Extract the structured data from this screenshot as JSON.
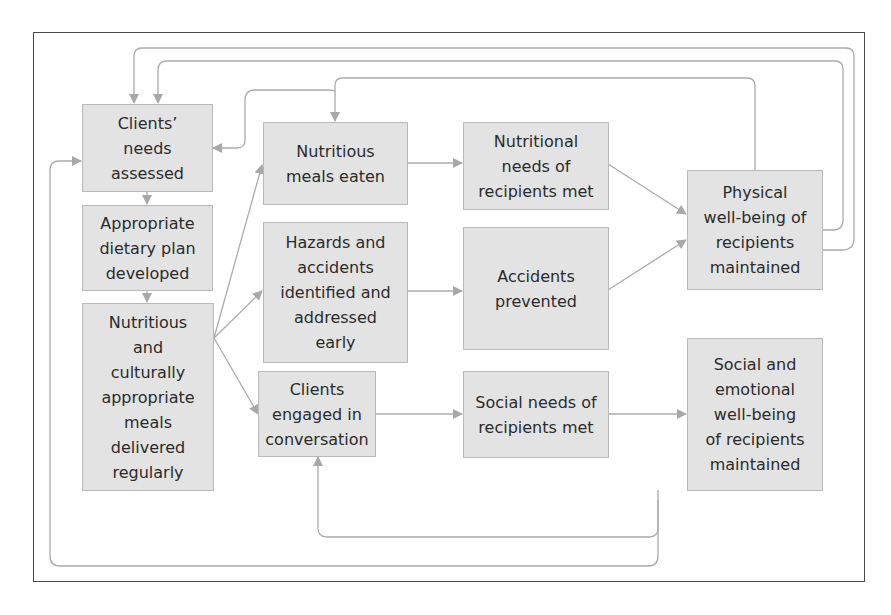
{
  "diagram": {
    "type": "logic-model-flowchart",
    "colors": {
      "box_fill": "#e3e3e3",
      "box_border": "#b9b9b9",
      "arrow": "#a8a8a8",
      "frame": "#4a4a4a",
      "text": "#2b2b2b"
    },
    "nodes": [
      {
        "id": "needs",
        "label": "Clients' needs assessed"
      },
      {
        "id": "plan",
        "label": "Appropriate dietary plan developed"
      },
      {
        "id": "meals",
        "label": "Nutritious and culturally appropriate meals delivered regularly"
      },
      {
        "id": "eaten",
        "label": "Nutritious meals eaten"
      },
      {
        "id": "hazards",
        "label": "Hazards and accidents identified and addressed early"
      },
      {
        "id": "conversation",
        "label": "Clients engaged in conversation"
      },
      {
        "id": "nutr_met",
        "label": "Nutritional needs of recipients met"
      },
      {
        "id": "acc_prev",
        "label": "Accidents prevented"
      },
      {
        "id": "social_met",
        "label": "Social needs of recipients met"
      },
      {
        "id": "physical",
        "label": "Physical well-being of recipients maintained"
      },
      {
        "id": "emotional",
        "label": "Social and emotional well-being of recipients maintained"
      }
    ],
    "edges": [
      {
        "from": "needs",
        "to": "plan"
      },
      {
        "from": "plan",
        "to": "meals"
      },
      {
        "from": "meals",
        "to": "eaten"
      },
      {
        "from": "meals",
        "to": "hazards"
      },
      {
        "from": "meals",
        "to": "conversation"
      },
      {
        "from": "eaten",
        "to": "nutr_met"
      },
      {
        "from": "hazards",
        "to": "acc_prev"
      },
      {
        "from": "conversation",
        "to": "social_met"
      },
      {
        "from": "nutr_met",
        "to": "physical"
      },
      {
        "from": "acc_prev",
        "to": "physical"
      },
      {
        "from": "social_met",
        "to": "emotional"
      },
      {
        "from": "physical",
        "to": "eaten",
        "kind": "feedback"
      },
      {
        "from": "eaten",
        "to": "needs",
        "kind": "feedback"
      },
      {
        "from": "physical",
        "to": "needs",
        "kind": "feedback"
      },
      {
        "from": "physical",
        "to": "needs",
        "kind": "feedback"
      },
      {
        "from": "emotional",
        "to": "conversation",
        "kind": "feedback"
      },
      {
        "from": "emotional",
        "to": "needs",
        "kind": "feedback"
      }
    ]
  },
  "boxes": {
    "needs": [
      "Clients’",
      "needs",
      "assessed"
    ],
    "plan": [
      "Appropriate",
      "dietary plan",
      "developed"
    ],
    "meals": [
      "Nutritious",
      "and",
      "culturally",
      "appropriate",
      "meals",
      "delivered",
      "regularly"
    ],
    "eaten": [
      "Nutritious",
      "meals eaten"
    ],
    "hazards": [
      "Hazards and",
      "accidents",
      "identified and",
      "addressed",
      "early"
    ],
    "conversation": [
      "Clients",
      "engaged in",
      "conversation"
    ],
    "nutr_met": [
      "Nutritional",
      "needs of",
      "recipients met"
    ],
    "acc_prev": [
      "Accidents",
      "prevented"
    ],
    "social_met": [
      "Social needs of",
      "recipients met"
    ],
    "physical": [
      "Physical",
      "well-being of",
      "recipients",
      "maintained"
    ],
    "emotional": [
      "Social and",
      "emotional",
      "well-being",
      "of recipients",
      "maintained"
    ]
  }
}
